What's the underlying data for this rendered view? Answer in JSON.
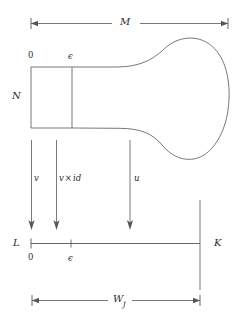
{
  "figure": {
    "title": "",
    "stroke_color": "#555555",
    "text_color": "#2b2b2b",
    "background": "#ffffff",
    "width": 243,
    "height": 320
  },
  "labels": {
    "top_dimension": "M",
    "bottom_dimension_base": "W",
    "bottom_dimension_sub": "J",
    "box_height": "N",
    "box_origin": "0",
    "box_epsilon": "ϵ",
    "line_left": "L",
    "line_right": "K",
    "line_origin": "0",
    "line_epsilon": "ϵ",
    "arrow_v": "v",
    "arrow_v_times_id_base": "v",
    "arrow_v_times_id_op": "×",
    "arrow_v_times_id_arg": "id",
    "arrow_u": "u"
  }
}
